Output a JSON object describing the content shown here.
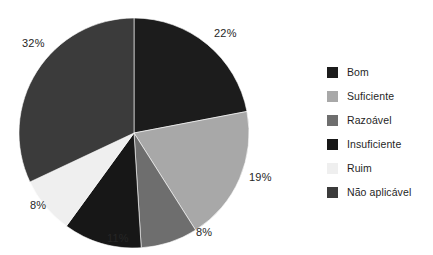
{
  "chart_data": {
    "type": "pie",
    "title": "",
    "subtitle": "",
    "xlabel": "",
    "ylabel": "",
    "grid": false,
    "legend_position": "right",
    "start_angle_deg": 0,
    "direction": "clockwise",
    "units": "percent",
    "total": 100,
    "categories": [
      "Bom",
      "Suficiente",
      "Razoável",
      "Insuficiente",
      "Ruim",
      "Não aplicável"
    ],
    "values": [
      22,
      19,
      8,
      11,
      8,
      32
    ],
    "data_labels": [
      "22%",
      "19%",
      "8%",
      "11%",
      "8%",
      "32%"
    ],
    "colors": [
      "#1c1c1c",
      "#a8a8a8",
      "#6e6e6e",
      "#171717",
      "#efefef",
      "#3b3b3b"
    ],
    "slices": [
      {
        "label": "Bom",
        "value": 22,
        "data_label": "22%",
        "color": "#1c1c1c"
      },
      {
        "label": "Suficiente",
        "value": 19,
        "data_label": "19%",
        "color": "#a8a8a8"
      },
      {
        "label": "Razoável",
        "value": 8,
        "data_label": "8%",
        "color": "#6e6e6e"
      },
      {
        "label": "Insuficiente",
        "value": 11,
        "data_label": "11%",
        "color": "#171717"
      },
      {
        "label": "Ruim",
        "value": 8,
        "data_label": "8%",
        "color": "#efefef"
      },
      {
        "label": "Não aplicável",
        "value": 32,
        "data_label": "32%",
        "color": "#3b3b3b"
      }
    ]
  },
  "legend": {
    "items": [
      {
        "label": "Bom",
        "color": "#1c1c1c"
      },
      {
        "label": "Suficiente",
        "color": "#a8a8a8"
      },
      {
        "label": "Razoável",
        "color": "#6e6e6e"
      },
      {
        "label": "Insuficiente",
        "color": "#171717"
      },
      {
        "label": "Ruim",
        "color": "#efefef"
      },
      {
        "label": "Não aplicável",
        "color": "#3b3b3b"
      }
    ]
  },
  "labels": {
    "top_right": "22%",
    "right": "19%",
    "bottom_right": "8%",
    "bottom_left": "11%",
    "left_lower": "8%",
    "top_left": "32%"
  }
}
